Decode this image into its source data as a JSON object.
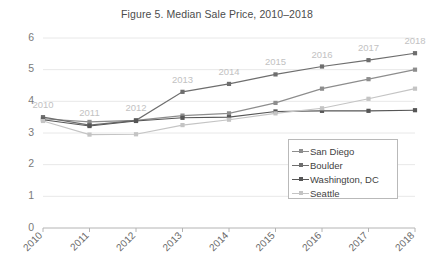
{
  "chart_data": {
    "type": "line",
    "title": "Figure 5. Median Sale Price, 2010–2018",
    "xlabel": "",
    "ylabel": "",
    "x": [
      "2010",
      "2011",
      "2012",
      "2013",
      "2014",
      "2015",
      "2016",
      "2017",
      "2018"
    ],
    "categories": [
      "2010",
      "2011",
      "2012",
      "2013",
      "2014",
      "2015",
      "2016",
      "2017",
      "2018"
    ],
    "ylim": [
      0,
      6
    ],
    "yticks": [
      "0",
      "1",
      "2",
      "3",
      "4",
      "5",
      "6"
    ],
    "grid": true,
    "legend_position": "inside-bottom-right",
    "point_labels": [
      "2010",
      "2011",
      "2012",
      "2013",
      "2014",
      "2015",
      "2016",
      "2017",
      "2018"
    ],
    "series": [
      {
        "name": "San Diego",
        "color": "#8d8d8d",
        "values": [
          3.45,
          3.35,
          3.4,
          3.55,
          3.62,
          3.95,
          4.4,
          4.7,
          5.0
        ]
      },
      {
        "name": "Boulder",
        "color": "#6e6e6e",
        "values": [
          3.5,
          3.25,
          3.4,
          4.3,
          4.55,
          4.85,
          5.1,
          5.3,
          5.52
        ]
      },
      {
        "name": "Washington, DC",
        "color": "#565656",
        "values": [
          3.42,
          3.22,
          3.38,
          3.48,
          3.5,
          3.68,
          3.7,
          3.7,
          3.72
        ]
      },
      {
        "name": "Seattle",
        "color": "#c4c4c4",
        "values": [
          3.38,
          2.95,
          2.96,
          3.25,
          3.42,
          3.62,
          3.78,
          4.08,
          4.4
        ]
      }
    ]
  },
  "legend": {
    "items": [
      {
        "label": "San Diego",
        "color": "#8d8d8d"
      },
      {
        "label": "Boulder",
        "color": "#6e6e6e"
      },
      {
        "label": "Washington, DC",
        "color": "#565656"
      },
      {
        "label": "Seattle",
        "color": "#c4c4c4"
      }
    ]
  }
}
